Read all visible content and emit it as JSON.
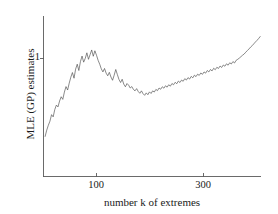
{
  "chart_data": {
    "type": "line",
    "title": "",
    "xlabel": "number k of extremes",
    "ylabel": "MLE (GP) estimates",
    "xlim": [
      1,
      408
    ],
    "ylim": [
      0.42,
      1.2
    ],
    "grid": false,
    "legend": null,
    "xticks": [
      {
        "value": 100,
        "label": "100"
      },
      {
        "value": 300,
        "label": "300"
      }
    ],
    "yticks": [
      {
        "value": 1,
        "label": "1"
      }
    ],
    "series": [
      {
        "name": "MLE (GP) estimates",
        "color": "#4a4a4a",
        "x": [
          4,
          7,
          10,
          13,
          16,
          19,
          22,
          25,
          28,
          31,
          34,
          37,
          40,
          43,
          46,
          49,
          52,
          55,
          58,
          61,
          64,
          67,
          70,
          73,
          76,
          79,
          82,
          85,
          88,
          91,
          94,
          97,
          100,
          103,
          106,
          109,
          112,
          115,
          118,
          121,
          124,
          127,
          130,
          133,
          136,
          139,
          142,
          145,
          148,
          151,
          154,
          157,
          160,
          163,
          166,
          169,
          172,
          175,
          178,
          181,
          184,
          187,
          190,
          193,
          196,
          199,
          202,
          205,
          208,
          211,
          214,
          217,
          220,
          223,
          226,
          229,
          232,
          235,
          238,
          241,
          244,
          247,
          250,
          253,
          256,
          259,
          262,
          265,
          268,
          271,
          274,
          277,
          280,
          283,
          286,
          289,
          292,
          295,
          298,
          301,
          304,
          307,
          310,
          313,
          316,
          319,
          322,
          325,
          328,
          331,
          334,
          337,
          340,
          343,
          346,
          349,
          352,
          355,
          358,
          361,
          364,
          367,
          370,
          373,
          376,
          379,
          382,
          385,
          388,
          391,
          394,
          397,
          400,
          403,
          406
        ],
        "y": [
          0.617,
          0.648,
          0.672,
          0.692,
          0.724,
          0.713,
          0.749,
          0.771,
          0.762,
          0.791,
          0.812,
          0.799,
          0.835,
          0.862,
          0.845,
          0.879,
          0.908,
          0.931,
          0.903,
          0.948,
          0.972,
          0.941,
          0.985,
          1.012,
          0.982,
          1.001,
          1.028,
          0.996,
          1.019,
          1.042,
          1.011,
          1.038,
          1.016,
          0.991,
          0.972,
          0.949,
          0.934,
          0.951,
          0.928,
          0.915,
          0.932,
          0.909,
          0.893,
          0.918,
          0.946,
          0.921,
          0.897,
          0.882,
          0.898,
          0.874,
          0.861,
          0.877,
          0.869,
          0.855,
          0.862,
          0.848,
          0.841,
          0.852,
          0.838,
          0.829,
          0.841,
          0.827,
          0.819,
          0.831,
          0.822,
          0.836,
          0.828,
          0.841,
          0.835,
          0.848,
          0.842,
          0.855,
          0.849,
          0.861,
          0.854,
          0.866,
          0.859,
          0.871,
          0.864,
          0.877,
          0.871,
          0.883,
          0.876,
          0.889,
          0.882,
          0.894,
          0.888,
          0.901,
          0.894,
          0.906,
          0.899,
          0.912,
          0.905,
          0.918,
          0.911,
          0.923,
          0.917,
          0.929,
          0.922,
          0.934,
          0.928,
          0.941,
          0.934,
          0.946,
          0.939,
          0.952,
          0.945,
          0.957,
          0.951,
          0.963,
          0.956,
          0.968,
          0.962,
          0.974,
          0.967,
          0.979,
          0.973,
          0.985,
          0.978,
          0.991,
          0.996,
          1.002,
          1.009,
          1.016,
          1.022,
          1.031,
          1.039,
          1.047,
          1.056,
          1.063,
          1.072,
          1.081,
          1.089,
          1.098,
          1.108
        ]
      }
    ]
  }
}
